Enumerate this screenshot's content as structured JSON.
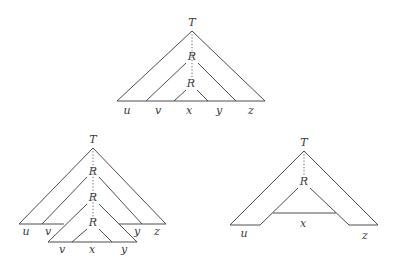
{
  "diagrams": [
    {
      "name": "top",
      "labels": {
        "root": "T",
        "inner1": "R",
        "inner2": "R",
        "u": "u",
        "v": "v",
        "x": "x",
        "y": "y",
        "z": "z"
      }
    },
    {
      "name": "bottom-left",
      "labels": {
        "root": "T",
        "inner1": "R",
        "inner2": "R",
        "inner3": "R",
        "u": "u",
        "v": "v",
        "y": "y",
        "z": "z",
        "v2": "v",
        "x": "x",
        "y2": "y"
      }
    },
    {
      "name": "bottom-right",
      "labels": {
        "root": "T",
        "inner1": "R",
        "u": "u",
        "x": "x",
        "z": "z"
      }
    }
  ],
  "colors": {
    "line": "#3a3a3a",
    "background": "#ffffff"
  }
}
